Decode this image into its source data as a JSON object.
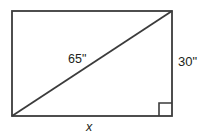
{
  "figure": {
    "kind": "rectangle-with-diagonal",
    "background_color": "#ffffff",
    "stroke_color": "#3b3b3b",
    "text_color": "#231f20",
    "rectangle": {
      "left": 12,
      "top": 11,
      "right": 172,
      "bottom": 116,
      "width": 160,
      "height": 105,
      "stroke_width": 1.8
    },
    "diagonal": {
      "from": {
        "x": 12,
        "y": 116
      },
      "to": {
        "x": 172,
        "y": 11
      },
      "stroke_width": 1.8
    },
    "right_angle_marker": {
      "corner": "bottom-right",
      "size": 13,
      "left": 159,
      "top": 103,
      "stroke_width": 1.6
    },
    "labels": {
      "diagonal": "65\"",
      "height": "30\"",
      "base": "x"
    }
  }
}
